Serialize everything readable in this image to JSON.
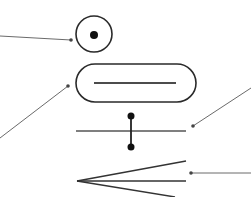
{
  "diagram": {
    "background": "#ffffff",
    "stroke_color": "#2a2a2a",
    "leader_color": "#6a6a6a",
    "symbols": [
      {
        "id": "circle-with-point",
        "type": "circle",
        "cx": 94,
        "cy": 34,
        "r": 18,
        "inner_dot": {
          "cx": 94,
          "cy": 35,
          "r": 4
        }
      },
      {
        "id": "rounded-slot",
        "type": "pill",
        "x": 76,
        "y": 64,
        "width": 120,
        "height": 38,
        "rx": 19,
        "inner_line": {
          "x1": 94,
          "y1": 83,
          "x2": 176,
          "y2": 83
        }
      },
      {
        "id": "line-with-link",
        "type": "line-with-connector",
        "line": {
          "x1": 76,
          "y1": 131,
          "x2": 186,
          "y2": 131
        },
        "connector": {
          "x": 131,
          "y1": 116,
          "y2": 147,
          "dot_r": 3.5
        }
      },
      {
        "id": "fork",
        "type": "chevron",
        "apex": {
          "x": 77,
          "y": 181
        },
        "ends": [
          {
            "x": 186,
            "y": 161
          },
          {
            "x": 186,
            "y": 181
          },
          {
            "x": 175,
            "y": 197
          }
        ]
      }
    ],
    "leaders": [
      {
        "id": "leader-circle",
        "from": {
          "x": 0,
          "y": 36
        },
        "to": {
          "x": 71,
          "y": 40
        }
      },
      {
        "id": "leader-slot",
        "from": {
          "x": 0,
          "y": 138
        },
        "to": {
          "x": 68,
          "y": 86
        }
      },
      {
        "id": "leader-line-link",
        "from": {
          "x": 251,
          "y": 88
        },
        "to": {
          "x": 193,
          "y": 126
        }
      },
      {
        "id": "leader-fork",
        "from": {
          "x": 251,
          "y": 173
        },
        "to": {
          "x": 191,
          "y": 173
        }
      }
    ]
  }
}
